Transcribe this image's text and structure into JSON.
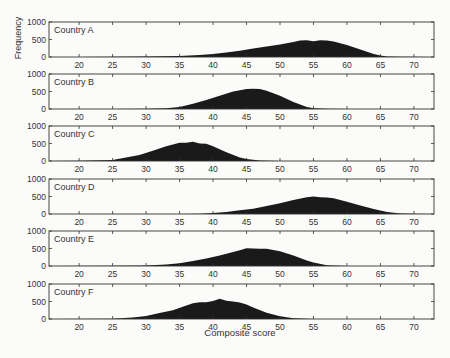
{
  "chart_data": {
    "type": "area",
    "title": "",
    "xlabel": "Composite score",
    "ylabel": "Frequency",
    "xlim": [
      15.5,
      73
    ],
    "ylim": [
      0,
      1000
    ],
    "x_ticks": [
      20,
      25,
      30,
      35,
      40,
      45,
      50,
      55,
      60,
      65,
      70
    ],
    "y_ticks": [
      0,
      500,
      1000
    ],
    "grid": false,
    "legend": "none",
    "panels": [
      {
        "label": "Country A",
        "x": [
          15,
          20,
          25,
          30,
          35,
          38,
          40,
          42,
          44,
          46,
          48,
          50,
          52,
          53,
          54,
          55,
          56,
          57,
          58,
          60,
          62,
          64,
          65,
          66,
          68,
          73
        ],
        "y": [
          0,
          0,
          5,
          10,
          30,
          60,
          90,
          130,
          180,
          240,
          300,
          360,
          430,
          470,
          480,
          450,
          480,
          470,
          440,
          340,
          210,
          90,
          40,
          15,
          5,
          0
        ]
      },
      {
        "label": "Country B",
        "x": [
          15,
          25,
          30,
          33,
          35,
          37,
          39,
          41,
          43,
          45,
          46,
          47,
          48,
          50,
          52,
          54,
          55,
          57,
          60,
          73
        ],
        "y": [
          0,
          0,
          5,
          20,
          60,
          150,
          260,
          380,
          500,
          570,
          580,
          570,
          520,
          380,
          200,
          60,
          20,
          5,
          0,
          0
        ]
      },
      {
        "label": "Country C",
        "x": [
          15,
          20,
          25,
          27,
          29,
          31,
          33,
          35,
          36,
          37,
          38,
          39,
          40,
          42,
          44,
          45,
          47,
          50,
          73
        ],
        "y": [
          0,
          5,
          30,
          100,
          170,
          290,
          420,
          520,
          520,
          550,
          500,
          490,
          420,
          250,
          100,
          60,
          15,
          0,
          0
        ]
      },
      {
        "label": "Country D",
        "x": [
          15,
          35,
          38,
          40,
          42,
          44,
          46,
          48,
          50,
          52,
          54,
          55,
          56,
          57,
          58,
          60,
          62,
          64,
          66,
          68,
          70,
          73
        ],
        "y": [
          0,
          0,
          10,
          30,
          60,
          110,
          150,
          230,
          310,
          400,
          480,
          500,
          480,
          470,
          450,
          350,
          240,
          140,
          60,
          15,
          5,
          0
        ]
      },
      {
        "label": "Country E",
        "x": [
          15,
          25,
          30,
          33,
          35,
          37,
          39,
          41,
          43,
          44,
          45,
          46,
          47,
          48,
          49,
          50,
          52,
          54,
          55,
          57,
          60,
          73
        ],
        "y": [
          0,
          5,
          15,
          40,
          80,
          140,
          210,
          300,
          400,
          450,
          510,
          500,
          490,
          490,
          460,
          420,
          300,
          160,
          100,
          20,
          0,
          0
        ]
      },
      {
        "label": "Country F",
        "x": [
          15,
          25,
          28,
          30,
          32,
          34,
          36,
          37,
          38,
          39,
          40,
          41,
          42,
          43,
          44,
          45,
          46,
          48,
          50,
          52,
          55,
          73
        ],
        "y": [
          0,
          5,
          40,
          90,
          170,
          250,
          390,
          450,
          480,
          480,
          510,
          580,
          520,
          500,
          470,
          410,
          330,
          180,
          80,
          20,
          0,
          0
        ]
      }
    ]
  }
}
